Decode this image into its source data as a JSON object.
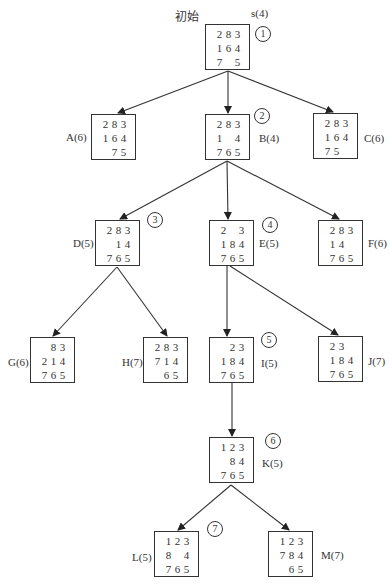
{
  "diagram": {
    "start_label": "初始"
  },
  "nodes": {
    "s": {
      "label": "s(4)",
      "order": "1",
      "board": [
        [
          "2",
          "8",
          "3"
        ],
        [
          "1",
          "6",
          "4"
        ],
        [
          "7",
          "",
          "5"
        ]
      ]
    },
    "A": {
      "label": "A(6)",
      "board": [
        [
          "2",
          "8",
          "3"
        ],
        [
          "1",
          "6",
          "4"
        ],
        [
          "",
          "7",
          "5"
        ]
      ]
    },
    "B": {
      "label": "B(4)",
      "order": "2",
      "board": [
        [
          "2",
          "8",
          "3"
        ],
        [
          "1",
          "",
          "4"
        ],
        [
          "7",
          "6",
          "5"
        ]
      ]
    },
    "C": {
      "label": "C(6)",
      "board": [
        [
          "2",
          "8",
          "3"
        ],
        [
          "1",
          "6",
          "4"
        ],
        [
          "7",
          "5",
          ""
        ]
      ]
    },
    "D": {
      "label": "D(5)",
      "order": "3",
      "board": [
        [
          "2",
          "8",
          "3"
        ],
        [
          "",
          "1",
          "4"
        ],
        [
          "7",
          "6",
          "5"
        ]
      ]
    },
    "E": {
      "label": "E(5)",
      "order": "4",
      "board": [
        [
          "2",
          "",
          "3"
        ],
        [
          "1",
          "8",
          "4"
        ],
        [
          "7",
          "6",
          "5"
        ]
      ]
    },
    "F": {
      "label": "F(6)",
      "board": [
        [
          "2",
          "8",
          "3"
        ],
        [
          "1",
          "4",
          ""
        ],
        [
          "7",
          "6",
          "5"
        ]
      ]
    },
    "G": {
      "label": "G(6)",
      "board": [
        [
          "",
          "8",
          "3"
        ],
        [
          "2",
          "1",
          "4"
        ],
        [
          "7",
          "6",
          "5"
        ]
      ]
    },
    "H": {
      "label": "H(7)",
      "board": [
        [
          "2",
          "8",
          "3"
        ],
        [
          "7",
          "1",
          "4"
        ],
        [
          "",
          "6",
          "5"
        ]
      ]
    },
    "I": {
      "label": "I(5)",
      "order": "5",
      "board": [
        [
          "",
          "2",
          "3"
        ],
        [
          "1",
          "8",
          "4"
        ],
        [
          "7",
          "6",
          "5"
        ]
      ]
    },
    "J": {
      "label": "J(7)",
      "board": [
        [
          "2",
          "3",
          ""
        ],
        [
          "1",
          "8",
          "4"
        ],
        [
          "7",
          "6",
          "5"
        ]
      ]
    },
    "K": {
      "label": "K(5)",
      "order": "6",
      "board": [
        [
          "1",
          "2",
          "3"
        ],
        [
          "",
          "8",
          "4"
        ],
        [
          "7",
          "6",
          "5"
        ]
      ]
    },
    "L": {
      "label": "L(5)",
      "order": "7",
      "board": [
        [
          "1",
          "2",
          "3"
        ],
        [
          "8",
          "",
          "4"
        ],
        [
          "7",
          "6",
          "5"
        ]
      ]
    },
    "M": {
      "label": "M(7)",
      "board": [
        [
          "1",
          "2",
          "3"
        ],
        [
          "7",
          "8",
          "4"
        ],
        [
          "",
          "6",
          "5"
        ]
      ]
    }
  },
  "edges": [
    {
      "from": "s",
      "to": "A"
    },
    {
      "from": "s",
      "to": "B"
    },
    {
      "from": "s",
      "to": "C"
    },
    {
      "from": "B",
      "to": "D"
    },
    {
      "from": "B",
      "to": "E"
    },
    {
      "from": "B",
      "to": "F"
    },
    {
      "from": "D",
      "to": "G"
    },
    {
      "from": "D",
      "to": "H"
    },
    {
      "from": "E",
      "to": "I"
    },
    {
      "from": "E",
      "to": "J"
    },
    {
      "from": "I",
      "to": "K"
    },
    {
      "from": "K",
      "to": "L"
    },
    {
      "from": "K",
      "to": "M"
    }
  ]
}
